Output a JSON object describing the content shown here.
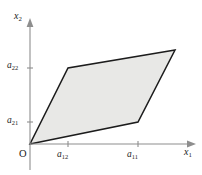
{
  "figure": {
    "type": "geometry-diagram",
    "background_color": "#ffffff",
    "shape": {
      "name": "parallelogram",
      "fill_color": "#e8e8e6",
      "stroke_color": "#1c1c1c",
      "vertices": [
        {
          "name": "origin",
          "x": 30,
          "y": 144
        },
        {
          "name": "vector-a1",
          "x": 138,
          "y": 122
        },
        {
          "name": "vector-sum",
          "x": 175,
          "y": 50
        },
        {
          "name": "vector-a2",
          "x": 68,
          "y": 68
        }
      ]
    },
    "axes": {
      "color": "#8e8e8e",
      "origin": {
        "x": 30,
        "y": 144
      },
      "x_axis": {
        "label": "x",
        "sub": "1",
        "from_x": 30,
        "to_x": 196,
        "y": 144
      },
      "y_axis": {
        "label": "x",
        "sub": "2",
        "from_y": 144,
        "to_y": 18,
        "x": 30
      }
    },
    "ticks": {
      "x": [
        {
          "label": "a",
          "sub": "12",
          "pos": 68
        },
        {
          "label": "a",
          "sub": "11",
          "pos": 138
        }
      ],
      "y": [
        {
          "label": "a",
          "sub": "22",
          "pos": 68
        },
        {
          "label": "a",
          "sub": "21",
          "pos": 122
        }
      ]
    },
    "labels": {
      "x1": {
        "base": "x",
        "sub": "1"
      },
      "x2": {
        "base": "x",
        "sub": "2"
      },
      "a11": {
        "base": "a",
        "sub": "11"
      },
      "a12": {
        "base": "a",
        "sub": "12"
      },
      "a21": {
        "base": "a",
        "sub": "21"
      },
      "a22": {
        "base": "a",
        "sub": "22"
      },
      "origin": "O"
    }
  }
}
